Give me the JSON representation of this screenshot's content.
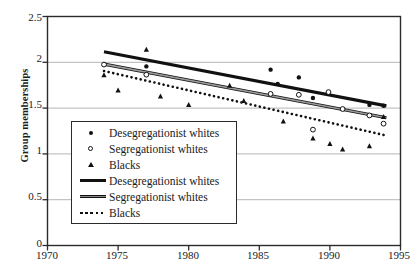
{
  "chart_data": {
    "type": "scatter",
    "title": "",
    "xlabel": "",
    "ylabel": "Group memberships",
    "xlim": [
      1970,
      1995
    ],
    "ylim": [
      0,
      2.5
    ],
    "xticks": [
      "1970",
      "1975",
      "1980",
      "1985",
      "1990",
      "1995"
    ],
    "yticks": [
      "0",
      "0.5",
      "1",
      "1.5",
      "2",
      "2.5"
    ],
    "grid": "horizontal",
    "legend_position": "inside-lower-left",
    "legend": [
      {
        "label": "Desegregationist whites",
        "marker": "filled-circle",
        "color": "#111111"
      },
      {
        "label": "Segregationist whites",
        "marker": "open-circle",
        "color": "#111111"
      },
      {
        "label": "Blacks",
        "marker": "filled-triangle",
        "color": "#111111"
      },
      {
        "label": "Desegregationist  whites",
        "marker": "thick-solid-line",
        "color": "#111111"
      },
      {
        "label": "Segregationist whites",
        "marker": "gray-solid-line",
        "color": "#8a8a8a"
      },
      {
        "label": "Blacks",
        "marker": "dotted-line",
        "color": "#111111"
      }
    ],
    "series": [
      {
        "name": "Desegregationist whites",
        "kind": "points",
        "marker": "filled-circle",
        "points": [
          {
            "x": 1977.0,
            "y": 1.955
          },
          {
            "x": 1985.8,
            "y": 1.92
          },
          {
            "x": 1986.3,
            "y": 1.765
          },
          {
            "x": 1987.8,
            "y": 1.835
          },
          {
            "x": 1988.8,
            "y": 1.61
          },
          {
            "x": 1989.9,
            "y": 1.665
          },
          {
            "x": 1992.8,
            "y": 1.535
          },
          {
            "x": 1993.8,
            "y": 1.525
          }
        ]
      },
      {
        "name": "Segregationist whites",
        "kind": "points",
        "marker": "open-circle",
        "points": [
          {
            "x": 1974.0,
            "y": 1.975
          },
          {
            "x": 1977.0,
            "y": 1.865
          },
          {
            "x": 1985.8,
            "y": 1.655
          },
          {
            "x": 1987.8,
            "y": 1.645
          },
          {
            "x": 1988.8,
            "y": 1.265
          },
          {
            "x": 1989.9,
            "y": 1.675
          },
          {
            "x": 1990.9,
            "y": 1.49
          },
          {
            "x": 1992.8,
            "y": 1.42
          },
          {
            "x": 1993.8,
            "y": 1.33
          }
        ]
      },
      {
        "name": "Blacks",
        "kind": "points",
        "marker": "filled-triangle",
        "points": [
          {
            "x": 1974.0,
            "y": 1.86
          },
          {
            "x": 1975.0,
            "y": 1.695
          },
          {
            "x": 1977.0,
            "y": 2.14
          },
          {
            "x": 1978.0,
            "y": 1.63
          },
          {
            "x": 1980.0,
            "y": 1.535
          },
          {
            "x": 1982.9,
            "y": 1.745
          },
          {
            "x": 1983.9,
            "y": 1.58
          },
          {
            "x": 1986.7,
            "y": 1.355
          },
          {
            "x": 1988.8,
            "y": 1.17
          },
          {
            "x": 1990.0,
            "y": 1.11
          },
          {
            "x": 1990.9,
            "y": 1.05
          },
          {
            "x": 1992.8,
            "y": 1.085
          },
          {
            "x": 1993.8,
            "y": 1.405
          }
        ]
      },
      {
        "name": "Desegregationist whites",
        "kind": "trend",
        "style": "thick-solid",
        "x_start": 1974.0,
        "y_start": 2.115,
        "x_end": 1994.0,
        "y_end": 1.525
      },
      {
        "name": "Segregationist whites",
        "kind": "trend",
        "style": "gray-solid",
        "x_start": 1974.0,
        "y_start": 1.98,
        "x_end": 1994.0,
        "y_end": 1.395
      },
      {
        "name": "Blacks",
        "kind": "trend",
        "style": "dotted",
        "x_start": 1974.0,
        "y_start": 1.905,
        "x_end": 1994.0,
        "y_end": 1.2
      }
    ]
  },
  "axes": {
    "frame_color": "#2b2b2b",
    "grid_color": "#b5b5b5"
  }
}
